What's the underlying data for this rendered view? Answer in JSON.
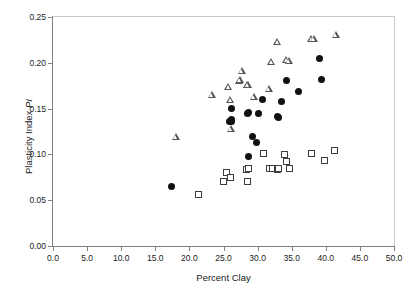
{
  "chart_data": {
    "type": "scatter",
    "title": "",
    "xlabel": "Percent Clay",
    "ylabel": "Plasticity Index PI",
    "ylabel_plain": "Plasticity Index ",
    "ylabel_italic": "PI",
    "xlim": [
      0.0,
      50.0
    ],
    "ylim": [
      0.0,
      0.25
    ],
    "xticks": [
      "0.0",
      "5.0",
      "10.0",
      "15.0",
      "20.0",
      "25.0",
      "30.0",
      "35.0",
      "40.0",
      "45.0",
      "50.0"
    ],
    "xtick_values": [
      0,
      5,
      10,
      15,
      20,
      25,
      30,
      35,
      40,
      45,
      50
    ],
    "yticks": [
      "0.00",
      "0.05",
      "0.10",
      "0.15",
      "0.20",
      "0.25"
    ],
    "ytick_values": [
      0.0,
      0.05,
      0.1,
      0.15,
      0.2,
      0.25
    ],
    "grid": false,
    "legend": "none",
    "series": [
      {
        "name": "filled-circle-series",
        "marker": "circle",
        "color": "#111111",
        "points": [
          [
            17.4,
            0.065
          ],
          [
            25.9,
            0.136
          ],
          [
            26.1,
            0.138
          ],
          [
            26.2,
            0.136
          ],
          [
            26.2,
            0.15
          ],
          [
            28.5,
            0.145
          ],
          [
            28.7,
            0.146
          ],
          [
            28.6,
            0.098
          ],
          [
            29.3,
            0.12
          ],
          [
            29.9,
            0.113
          ],
          [
            30.1,
            0.145
          ],
          [
            30.7,
            0.16
          ],
          [
            32.9,
            0.141
          ],
          [
            33.1,
            0.14
          ],
          [
            33.5,
            0.158
          ],
          [
            34.3,
            0.181
          ],
          [
            36.0,
            0.169
          ],
          [
            39.1,
            0.205
          ],
          [
            39.4,
            0.182
          ]
        ]
      },
      {
        "name": "open-triangle-series",
        "marker": "triangle",
        "color": "#555555",
        "points": [
          [
            18.0,
            0.119
          ],
          [
            23.3,
            0.165
          ],
          [
            25.7,
            0.174
          ],
          [
            26.0,
            0.16
          ],
          [
            26.1,
            0.128
          ],
          [
            27.3,
            0.18
          ],
          [
            27.4,
            0.182
          ],
          [
            27.7,
            0.191
          ],
          [
            28.5,
            0.176
          ],
          [
            28.6,
            0.176
          ],
          [
            29.4,
            0.163
          ],
          [
            31.6,
            0.172
          ],
          [
            32.0,
            0.201
          ],
          [
            32.9,
            0.223
          ],
          [
            34.2,
            0.203
          ],
          [
            34.6,
            0.202
          ],
          [
            37.9,
            0.226
          ],
          [
            38.2,
            0.226
          ],
          [
            41.5,
            0.231
          ]
        ]
      },
      {
        "name": "open-square-series",
        "marker": "square",
        "color": "#3d3d3d",
        "points": [
          [
            21.4,
            0.056
          ],
          [
            25.0,
            0.07
          ],
          [
            25.4,
            0.08
          ],
          [
            26.0,
            0.075
          ],
          [
            28.4,
            0.084
          ],
          [
            28.6,
            0.085
          ],
          [
            28.5,
            0.07
          ],
          [
            30.8,
            0.101
          ],
          [
            31.7,
            0.085
          ],
          [
            31.8,
            0.085
          ],
          [
            32.2,
            0.085
          ],
          [
            32.9,
            0.084
          ],
          [
            33.0,
            0.085
          ],
          [
            33.9,
            0.1
          ],
          [
            34.3,
            0.092
          ],
          [
            34.7,
            0.085
          ],
          [
            37.9,
            0.101
          ],
          [
            39.8,
            0.093
          ],
          [
            41.3,
            0.104
          ]
        ]
      }
    ]
  }
}
